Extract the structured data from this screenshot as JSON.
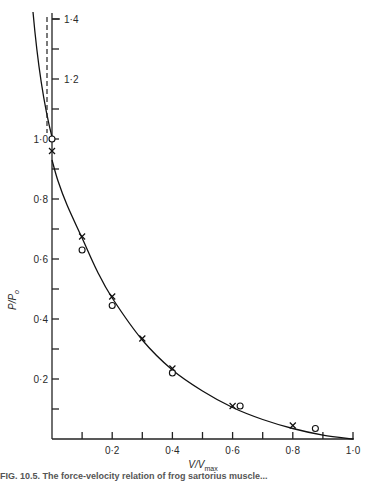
{
  "chart_data": {
    "type": "line",
    "title": "",
    "xlabel": "V/Vmax",
    "ylabel": "P/Po",
    "xlim": [
      0,
      1.0
    ],
    "ylim": [
      0,
      1.4
    ],
    "x_ticks": [
      "0·2",
      "0·4",
      "0·6",
      "0·8",
      "1·0"
    ],
    "y_ticks_lower": [
      "0·2",
      "0·4",
      "0·6",
      "0·8",
      "1·0"
    ],
    "y_ticks_upper": [
      "1·2",
      "1·4"
    ],
    "grid": false,
    "legend": null,
    "curve": {
      "name": "fitted force-velocity curve",
      "x": [
        0.0,
        0.02,
        0.05,
        0.1,
        0.15,
        0.2,
        0.3,
        0.4,
        0.5,
        0.6,
        0.7,
        0.8,
        0.9,
        1.0
      ],
      "y": [
        0.93,
        0.86,
        0.78,
        0.67,
        0.56,
        0.47,
        0.33,
        0.23,
        0.16,
        0.105,
        0.065,
        0.035,
        0.013,
        0.0
      ]
    },
    "upper_curve": {
      "name": "lengthening branch",
      "x": [
        -0.06,
        -0.04,
        -0.02,
        0.0
      ],
      "y": [
        1.42,
        1.3,
        1.16,
        1.0
      ]
    },
    "dashed_line": {
      "x": -0.015,
      "y_range": [
        1.0,
        1.4
      ]
    },
    "series": [
      {
        "name": "crosses",
        "marker": "x",
        "points": [
          [
            0.0,
            0.96
          ],
          [
            0.1,
            0.675
          ],
          [
            0.2,
            0.475
          ],
          [
            0.3,
            0.335
          ],
          [
            0.4,
            0.235
          ],
          [
            0.6,
            0.11
          ],
          [
            0.8,
            0.045
          ]
        ]
      },
      {
        "name": "circles",
        "marker": "o",
        "points": [
          [
            0.0,
            1.0
          ],
          [
            0.1,
            0.63
          ],
          [
            0.2,
            0.445
          ],
          [
            0.4,
            0.22
          ],
          [
            0.625,
            0.11
          ],
          [
            0.875,
            0.035
          ]
        ]
      }
    ]
  },
  "labels": {
    "ylabel_main": "P/P",
    "ylabel_sub": "o",
    "xlabel_main": "V/V",
    "xlabel_sub": "max",
    "caption": "FIG. 10.5.  The force-velocity relation of frog sartorius muscle..."
  }
}
